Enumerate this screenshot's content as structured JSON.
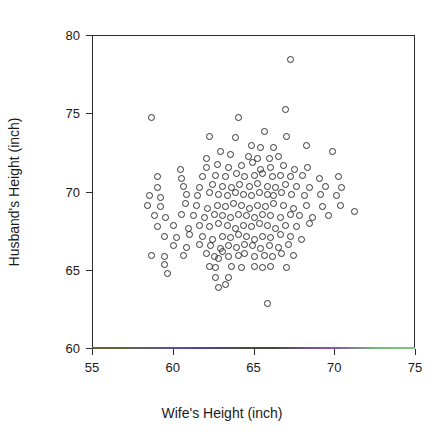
{
  "page": {
    "header_left": "",
    "header_right": ""
  },
  "chart_data": {
    "type": "scatter",
    "title": "",
    "xlabel": "Wife's Height (inch)",
    "ylabel": "Husband's Height (inch)",
    "xlim": [
      55,
      75
    ],
    "ylim": [
      60,
      80
    ],
    "xticks": [
      55,
      60,
      65,
      70,
      75
    ],
    "yticks": [
      60,
      65,
      70,
      75,
      80
    ],
    "grid": false,
    "legend": null,
    "marker": "open-circle",
    "marker_color": "#2f2f37",
    "marker_size_px": 7,
    "axis_color": "#2b2b33",
    "axis_tint_colors": [
      "#6b6b3a",
      "#4a4ab8",
      "#4a4a42",
      "#9a62b2",
      "#8ee09a"
    ],
    "n_points": 199,
    "series": [
      {
        "name": "couples",
        "points": [
          [
            67.2,
            78.5
          ],
          [
            58.6,
            74.8
          ],
          [
            64.0,
            74.8
          ],
          [
            66.9,
            75.3
          ],
          [
            62.2,
            73.6
          ],
          [
            63.8,
            73.5
          ],
          [
            65.6,
            73.9
          ],
          [
            67.0,
            73.6
          ],
          [
            64.8,
            73.0
          ],
          [
            65.4,
            72.9
          ],
          [
            66.2,
            72.9
          ],
          [
            68.2,
            73.0
          ],
          [
            62.0,
            72.2
          ],
          [
            62.9,
            72.6
          ],
          [
            63.5,
            72.4
          ],
          [
            64.6,
            72.3
          ],
          [
            65.2,
            72.2
          ],
          [
            65.9,
            72.2
          ],
          [
            66.5,
            72.3
          ],
          [
            69.8,
            72.6
          ],
          [
            60.4,
            71.5
          ],
          [
            62.0,
            71.6
          ],
          [
            62.7,
            71.8
          ],
          [
            63.4,
            71.6
          ],
          [
            64.2,
            71.7
          ],
          [
            64.9,
            71.9
          ],
          [
            65.4,
            71.5
          ],
          [
            66.0,
            71.6
          ],
          [
            66.8,
            71.7
          ],
          [
            67.5,
            71.5
          ],
          [
            68.3,
            71.6
          ],
          [
            59.0,
            71.0
          ],
          [
            60.5,
            70.9
          ],
          [
            61.8,
            71.0
          ],
          [
            62.6,
            71.1
          ],
          [
            63.2,
            71.0
          ],
          [
            63.9,
            71.2
          ],
          [
            64.4,
            71.0
          ],
          [
            65.0,
            71.1
          ],
          [
            65.5,
            71.2
          ],
          [
            66.1,
            71.0
          ],
          [
            66.6,
            71.1
          ],
          [
            67.2,
            71.0
          ],
          [
            68.0,
            71.1
          ],
          [
            69.0,
            70.9
          ],
          [
            70.2,
            71.0
          ],
          [
            59.0,
            70.3
          ],
          [
            60.6,
            70.4
          ],
          [
            61.6,
            70.3
          ],
          [
            62.4,
            70.5
          ],
          [
            63.0,
            70.4
          ],
          [
            63.6,
            70.3
          ],
          [
            64.1,
            70.5
          ],
          [
            64.7,
            70.4
          ],
          [
            65.2,
            70.6
          ],
          [
            65.8,
            70.4
          ],
          [
            66.3,
            70.3
          ],
          [
            66.9,
            70.5
          ],
          [
            67.6,
            70.4
          ],
          [
            68.4,
            70.3
          ],
          [
            69.4,
            70.4
          ],
          [
            70.4,
            70.3
          ],
          [
            58.5,
            69.8
          ],
          [
            59.2,
            69.7
          ],
          [
            60.8,
            69.9
          ],
          [
            61.5,
            69.8
          ],
          [
            62.2,
            70.0
          ],
          [
            62.8,
            69.9
          ],
          [
            63.3,
            69.8
          ],
          [
            63.8,
            70.0
          ],
          [
            64.3,
            69.9
          ],
          [
            64.8,
            69.8
          ],
          [
            65.3,
            70.0
          ],
          [
            65.8,
            69.9
          ],
          [
            66.2,
            69.8
          ],
          [
            66.7,
            70.0
          ],
          [
            67.3,
            69.9
          ],
          [
            68.1,
            69.8
          ],
          [
            69.1,
            69.9
          ],
          [
            70.1,
            69.8
          ],
          [
            58.4,
            69.2
          ],
          [
            59.2,
            69.1
          ],
          [
            60.7,
            69.3
          ],
          [
            61.4,
            69.2
          ],
          [
            62.1,
            69.0
          ],
          [
            62.7,
            69.2
          ],
          [
            63.2,
            69.1
          ],
          [
            63.7,
            69.3
          ],
          [
            64.2,
            69.2
          ],
          [
            64.7,
            69.0
          ],
          [
            65.2,
            69.2
          ],
          [
            65.7,
            69.1
          ],
          [
            66.2,
            69.3
          ],
          [
            66.8,
            69.2
          ],
          [
            67.4,
            69.0
          ],
          [
            68.2,
            69.2
          ],
          [
            69.2,
            69.1
          ],
          [
            70.3,
            69.2
          ],
          [
            71.2,
            68.8
          ],
          [
            58.8,
            68.5
          ],
          [
            59.5,
            68.4
          ],
          [
            60.5,
            68.6
          ],
          [
            61.2,
            68.5
          ],
          [
            61.9,
            68.4
          ],
          [
            62.5,
            68.6
          ],
          [
            63.0,
            68.5
          ],
          [
            63.5,
            68.4
          ],
          [
            64.0,
            68.6
          ],
          [
            64.5,
            68.5
          ],
          [
            65.0,
            68.4
          ],
          [
            65.5,
            68.6
          ],
          [
            66.0,
            68.5
          ],
          [
            66.6,
            68.4
          ],
          [
            67.2,
            68.6
          ],
          [
            67.8,
            68.5
          ],
          [
            68.6,
            68.4
          ],
          [
            69.6,
            68.5
          ],
          [
            59.0,
            67.8
          ],
          [
            60.0,
            67.9
          ],
          [
            60.9,
            67.7
          ],
          [
            61.6,
            67.9
          ],
          [
            62.2,
            67.8
          ],
          [
            62.8,
            68.0
          ],
          [
            63.3,
            67.9
          ],
          [
            63.8,
            67.7
          ],
          [
            64.3,
            67.9
          ],
          [
            64.8,
            67.8
          ],
          [
            65.3,
            68.0
          ],
          [
            65.8,
            67.9
          ],
          [
            66.3,
            67.7
          ],
          [
            66.9,
            67.9
          ],
          [
            67.6,
            67.8
          ],
          [
            68.4,
            68.0
          ],
          [
            59.4,
            67.2
          ],
          [
            60.2,
            67.1
          ],
          [
            61.0,
            67.3
          ],
          [
            61.8,
            67.2
          ],
          [
            62.4,
            67.0
          ],
          [
            63.0,
            67.2
          ],
          [
            63.5,
            67.1
          ],
          [
            64.0,
            67.3
          ],
          [
            64.5,
            67.2
          ],
          [
            65.0,
            67.0
          ],
          [
            65.5,
            67.2
          ],
          [
            66.0,
            67.1
          ],
          [
            66.6,
            67.3
          ],
          [
            67.2,
            67.2
          ],
          [
            67.9,
            67.0
          ],
          [
            60.0,
            66.6
          ],
          [
            60.8,
            66.5
          ],
          [
            61.6,
            66.7
          ],
          [
            62.3,
            66.6
          ],
          [
            62.9,
            66.4
          ],
          [
            63.4,
            66.6
          ],
          [
            63.9,
            66.5
          ],
          [
            64.4,
            66.7
          ],
          [
            64.9,
            66.6
          ],
          [
            65.4,
            66.4
          ],
          [
            65.9,
            66.6
          ],
          [
            66.5,
            66.5
          ],
          [
            67.1,
            66.7
          ],
          [
            58.6,
            66.0
          ],
          [
            59.4,
            65.9
          ],
          [
            59.4,
            65.4
          ],
          [
            60.6,
            66.0
          ],
          [
            62.0,
            66.1
          ],
          [
            62.5,
            65.9
          ],
          [
            62.8,
            65.8
          ],
          [
            63.0,
            66.2
          ],
          [
            63.4,
            65.9
          ],
          [
            64.0,
            66.0
          ],
          [
            64.4,
            66.1
          ],
          [
            65.0,
            65.9
          ],
          [
            65.6,
            66.0
          ],
          [
            66.1,
            65.9
          ],
          [
            66.7,
            66.1
          ],
          [
            67.4,
            66.0
          ],
          [
            62.2,
            65.3
          ],
          [
            62.6,
            65.2
          ],
          [
            63.6,
            65.3
          ],
          [
            64.2,
            65.2
          ],
          [
            65.0,
            65.3
          ],
          [
            65.5,
            65.2
          ],
          [
            66.0,
            65.3
          ],
          [
            67.0,
            65.2
          ],
          [
            59.6,
            64.8
          ],
          [
            62.6,
            64.6
          ],
          [
            63.4,
            64.6
          ],
          [
            62.8,
            63.9
          ],
          [
            63.2,
            64.1
          ],
          [
            65.8,
            62.9
          ]
        ]
      }
    ]
  }
}
